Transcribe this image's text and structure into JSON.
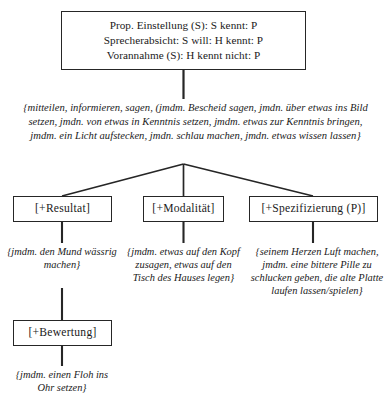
{
  "diagram": {
    "line_color": "#262626",
    "background": "#ffffff"
  },
  "root_box": {
    "name": "speech-act-conditions",
    "lines": [
      "Prop. Einstellung (S): S kennt: P",
      "Sprecherabsicht: S will: H kennt: P",
      "Vorannahme (S): H kennt nicht: P"
    ]
  },
  "main_gloss": {
    "name": "main-verb-gloss",
    "text": "{mitteilen, informieren, sagen, (jmdm. Bescheid sagen, jmdn. über etwas ins Bild setzen, jmdn. von etwas in Kenntnis setzen, jmdm. etwas zur Kenntnis bringen, jmdm. ein Licht aufstecken, jmdn. schlau machen, jmdn. etwas wissen lassen}"
  },
  "branches": [
    {
      "label": "[+Resultat]",
      "gloss": "{jmdm. den Mund wässrig machen}"
    },
    {
      "label": "[+Modalität]",
      "gloss": "{jmdm. etwas auf den Kopf zusagen, etwas auf den Tisch des Hauses legen}"
    },
    {
      "label": "[+Spezifizierung (P)]",
      "gloss": "{seinem Herzen Luft machen, jmdm. eine bittere Pille zu schlucken geben, die alte Platte laufen lassen/spielen}"
    }
  ],
  "sub_branch": {
    "label": "[+Bewertung]",
    "gloss": "{jmdm. einen Floh ins Ohr setzen}"
  }
}
